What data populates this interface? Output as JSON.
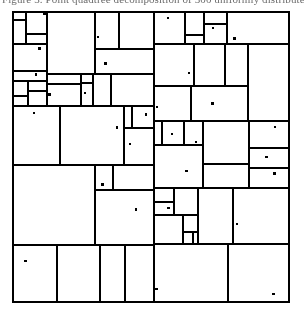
{
  "figure": {
    "caption_line": "Figure 3.  Point quadtree decomposition of 300 uniformly distributed points.",
    "type": "point-quadtree-subdivision",
    "title": "",
    "frame": {
      "x": 12,
      "y": 11,
      "width": 278,
      "height": 292,
      "border_color": "#000000",
      "border_width_px": 2,
      "fill_color": "#ffffff"
    },
    "style": {
      "line_color": "#000000",
      "line_width_px": 1.15,
      "point_color": "#000000",
      "point_size_px": 2.4,
      "point_shape": "square",
      "background": "#ffffff"
    },
    "subdivision": {
      "scheme": "recursive-binary-split",
      "max_depth": 7,
      "min_cell_px": 5,
      "split_probability": 0.78,
      "point_probability": 0.42,
      "random_seed": 20117,
      "split_jitter": 0.26,
      "deep_cluster_count": 14,
      "leaf_count_approx": 620,
      "point_count_approx": 265
    },
    "axes": {
      "show_ticks": false,
      "show_labels": false,
      "xlim": [
        0,
        1
      ],
      "ylim": [
        0,
        1
      ]
    }
  }
}
